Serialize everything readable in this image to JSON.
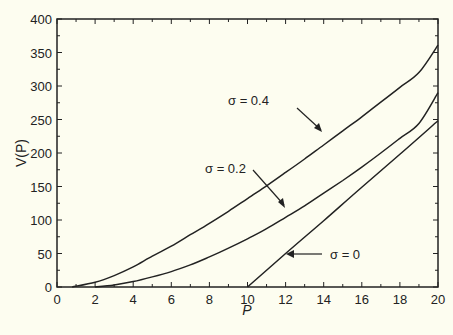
{
  "chart_data": {
    "type": "line",
    "title": "",
    "xlabel": "P",
    "ylabel": "V(P)",
    "xlim": [
      0,
      20
    ],
    "ylim": [
      0,
      400
    ],
    "xticks": [
      0,
      2,
      4,
      6,
      8,
      10,
      12,
      14,
      16,
      18,
      20
    ],
    "yticks": [
      0,
      50,
      100,
      150,
      200,
      250,
      300,
      350,
      400
    ],
    "grid": false,
    "legend": "none (inline annotations with arrows)",
    "series": [
      {
        "name": "σ = 0.4",
        "x": [
          0.8,
          2,
          3,
          4,
          5,
          6,
          7,
          8,
          9,
          10,
          11,
          12,
          13,
          14,
          15,
          16,
          17,
          18,
          19,
          20
        ],
        "values": [
          0,
          7,
          17,
          30,
          46,
          61,
          78,
          95,
          113,
          132,
          151,
          171,
          191,
          212,
          233,
          254,
          276,
          298,
          320,
          361
        ]
      },
      {
        "name": "σ = 0.2",
        "x": [
          2,
          3,
          4,
          5,
          6,
          7,
          8,
          9,
          10,
          11,
          12,
          13,
          14,
          15,
          16,
          17,
          18,
          19,
          20
        ],
        "values": [
          0,
          3,
          8,
          15,
          23,
          33,
          45,
          58,
          72,
          87,
          104,
          121,
          140,
          159,
          179,
          200,
          222,
          244,
          290
        ]
      },
      {
        "name": "σ = 0",
        "x": [
          10,
          12,
          14,
          16,
          18,
          20
        ],
        "values": [
          0,
          50,
          99,
          149,
          198,
          248
        ]
      }
    ],
    "annotations": [
      {
        "text": "σ = 0.4",
        "arrow_to": [
          13.6,
          233
        ]
      },
      {
        "text": "σ = 0.2",
        "arrow_to": [
          11.9,
          119
        ]
      },
      {
        "text": "σ = 0",
        "arrow_to": [
          12.0,
          49
        ]
      }
    ]
  },
  "labels": {
    "xlabel": "P",
    "ylabel": "V(P)",
    "ann_04": "σ = 0.4",
    "ann_02": "σ = 0.2",
    "ann_0": "σ = 0"
  }
}
